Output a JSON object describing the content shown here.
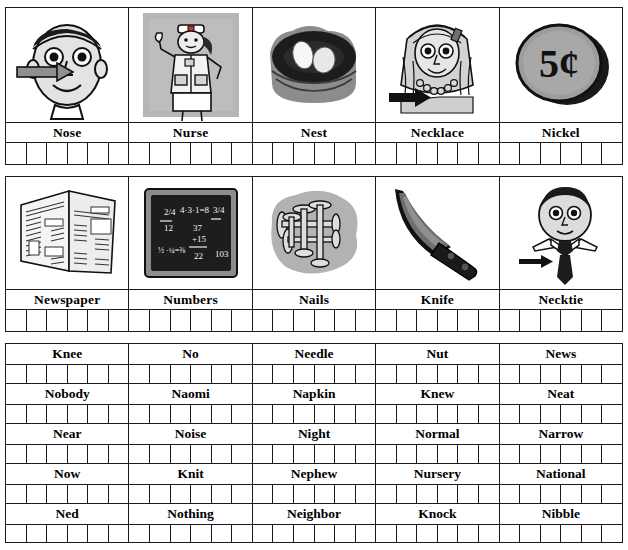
{
  "worksheet": {
    "letter_focus": "N",
    "picture_rows": [
      {
        "items": [
          {
            "label": "Nose",
            "icon": "face-with-nose-arrow-icon",
            "trace_boxes": 6
          },
          {
            "label": "Nurse",
            "icon": "nurse-icon",
            "trace_boxes": 6
          },
          {
            "label": "Nest",
            "icon": "nest-with-eggs-icon",
            "trace_boxes": 6
          },
          {
            "label": "Necklace",
            "icon": "necklace-icon",
            "trace_boxes": 6
          },
          {
            "label": "Nickel",
            "icon": "nickel-coin-icon",
            "trace_boxes": 6
          }
        ]
      },
      {
        "items": [
          {
            "label": "Newspaper",
            "icon": "newspaper-icon",
            "trace_boxes": 6
          },
          {
            "label": "Numbers",
            "icon": "chalkboard-numbers-icon",
            "trace_boxes": 6
          },
          {
            "label": "Nails",
            "icon": "nails-icon",
            "trace_boxes": 6
          },
          {
            "label": "Knife",
            "icon": "knife-icon",
            "trace_boxes": 6
          },
          {
            "label": "Necktie",
            "icon": "necktie-icon",
            "trace_boxes": 6
          }
        ]
      }
    ],
    "word_table": {
      "columns": 5,
      "boxes_per_cell": 6,
      "rows": [
        [
          "Knee",
          "No",
          "Needle",
          "Nut",
          "News"
        ],
        [
          "Nobody",
          "Naomi",
          "Napkin",
          "Knew",
          "Neat"
        ],
        [
          "Near",
          "Noise",
          "Night",
          "Normal",
          "Narrow"
        ],
        [
          "Now",
          "Knit",
          "Nephew",
          "Nursery",
          "National"
        ],
        [
          "Ned",
          "Nothing",
          "Neighbor",
          "Knock",
          "Nibble"
        ]
      ]
    },
    "coin_text": "5¢",
    "chalkboard_text": [
      "2/4",
      "4·3·1=8",
      "3/4",
      "12",
      "37",
      "+15",
      "22",
      "103"
    ]
  }
}
